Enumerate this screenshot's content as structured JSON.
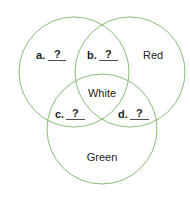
{
  "diagram": {
    "type": "venn",
    "line_color": "#86bd74",
    "text_color": "#231f20",
    "circles": [
      {
        "id": "left",
        "cx": 74,
        "cy": 72,
        "r": 55
      },
      {
        "id": "right",
        "cx": 130,
        "cy": 72,
        "r": 55
      },
      {
        "id": "bottom",
        "cx": 102,
        "cy": 129,
        "r": 55
      }
    ],
    "labels": {
      "red": "Red",
      "white": "White",
      "green": "Green"
    },
    "blanks": [
      {
        "letter": "a.",
        "answer": "?"
      },
      {
        "letter": "b.",
        "answer": "?"
      },
      {
        "letter": "c.",
        "answer": "?"
      },
      {
        "letter": "d.",
        "answer": "?"
      }
    ]
  }
}
